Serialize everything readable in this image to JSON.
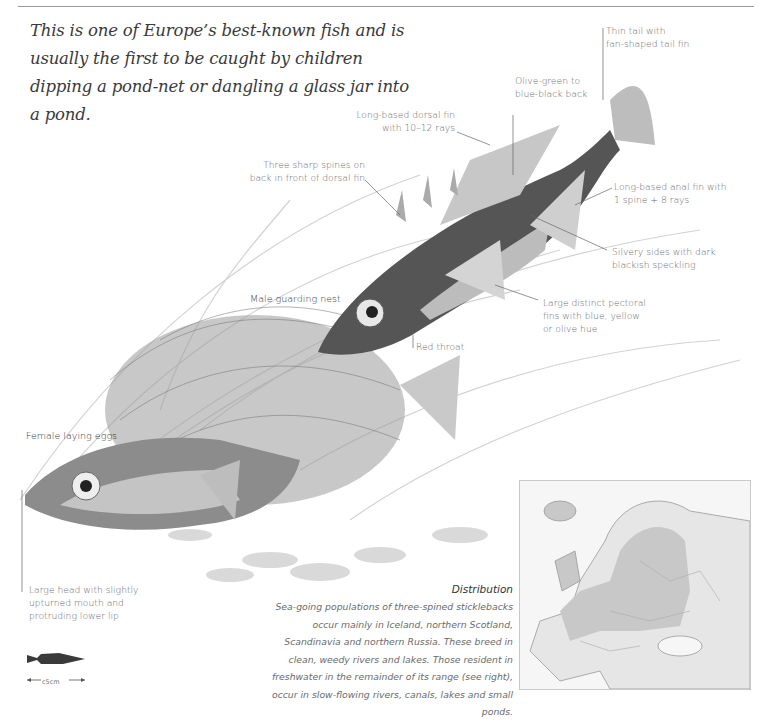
{
  "intro": "This is one of Europe’s best-known fish and is usually the first to be caught by children dipping a pond-net or dangling a glass jar into a pond.",
  "labels": {
    "tail": [
      "Thin tail with",
      "fan-shaped tail fin"
    ],
    "back": [
      "Olive-green to",
      "blue-black back"
    ],
    "dorsal": [
      "Long-based dorsal fin",
      "with 10–12 rays"
    ],
    "spines": [
      "Three sharp spines on",
      "back in front of dorsal fin"
    ],
    "anal": [
      "Long-based anal fin with",
      "1 spine + 8 rays"
    ],
    "sides": [
      "Silvery sides with dark",
      "blackish speckling"
    ],
    "pectoral": [
      "Large distinct pectoral",
      "fins with blue, yellow",
      "or olive hue"
    ],
    "male": "Male guarding nest",
    "throat": "Red throat",
    "female": "Female laying eggs",
    "head": [
      "Large head with slightly",
      "upturned mouth and",
      "protruding lower lip"
    ]
  },
  "distribution": {
    "title": "Distribution",
    "text": "Sea-going populations of three-spined sticklebacks occur mainly in Iceland, northern Scotland, Scandinavia and northern Russia. These breed in clean, weedy rivers and lakes. Those resident in freshwater in the remainder of its range (see right), occur in slow-flowing rivers, canals, lakes and small ponds."
  },
  "scale": {
    "label": "c5cm"
  },
  "colors": {
    "text": "#3a3a3a",
    "label": "#6a6a6a",
    "range_shade": "#c8c8c8",
    "land": "#e6e6e6"
  }
}
